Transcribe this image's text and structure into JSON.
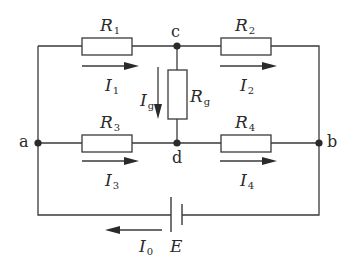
{
  "diagram": {
    "type": "circuit-bridge",
    "colors": {
      "line": "#3a3a3a",
      "text": "#2a2a2a",
      "background": "#ffffff"
    },
    "nodes": {
      "a": "a",
      "b": "b",
      "c": "c",
      "d": "d"
    },
    "resistors": {
      "r1": {
        "symbol": "R",
        "sub": "1"
      },
      "r2": {
        "symbol": "R",
        "sub": "2"
      },
      "r3": {
        "symbol": "R",
        "sub": "3"
      },
      "r4": {
        "symbol": "R",
        "sub": "4"
      },
      "rg": {
        "symbol": "R",
        "sub": "g"
      }
    },
    "currents": {
      "i1": {
        "symbol": "I",
        "sub": "1"
      },
      "i2": {
        "symbol": "I",
        "sub": "2"
      },
      "i3": {
        "symbol": "I",
        "sub": "3"
      },
      "i4": {
        "symbol": "I",
        "sub": "4"
      },
      "ig": {
        "symbol": "I",
        "sub": "g"
      },
      "i0": {
        "symbol": "I",
        "sub": "0"
      }
    },
    "source": {
      "symbol": "E"
    }
  }
}
